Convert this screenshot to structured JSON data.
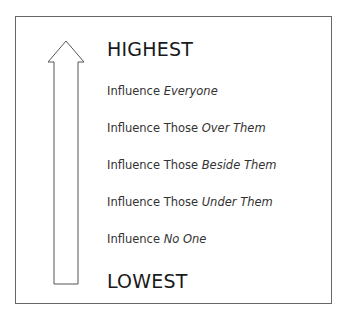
{
  "diagram": {
    "top_label": "HIGHEST",
    "bottom_label": "LOWEST",
    "arrow_direction": "up",
    "levels": [
      {
        "prefix": "Influence ",
        "emphasis": "Everyone"
      },
      {
        "prefix": "Influence Those ",
        "emphasis": "Over Them"
      },
      {
        "prefix": "Influence Those ",
        "emphasis": "Beside Them"
      },
      {
        "prefix": "Influence Those ",
        "emphasis": "Under Them"
      },
      {
        "prefix": "Influence ",
        "emphasis": "No One"
      }
    ]
  }
}
